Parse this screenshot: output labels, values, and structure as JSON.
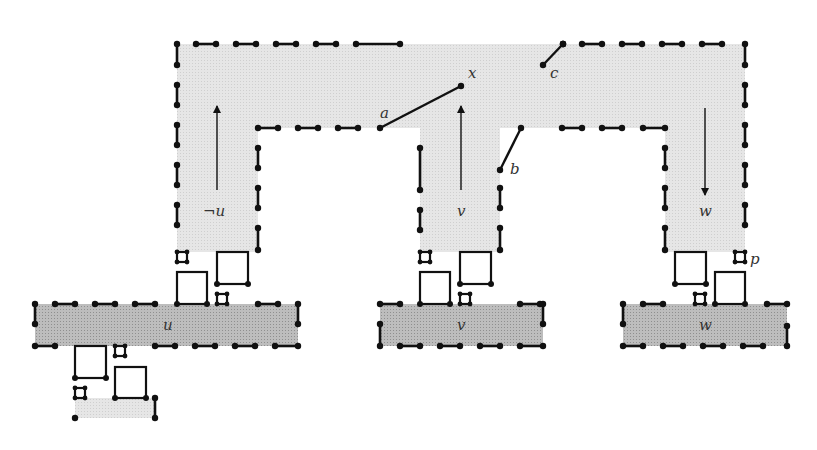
{
  "colors": {
    "background": "#ffffff",
    "light_region": "#e4e4e4",
    "dark_region": "#b4b4b4",
    "stroke": "#111111",
    "label": "#333333"
  },
  "light_regions": [
    {
      "name": "top-bar",
      "x": 177,
      "y": 44,
      "w": 568,
      "h": 84
    },
    {
      "name": "left-leg",
      "x": 177,
      "y": 128,
      "w": 81,
      "h": 124
    },
    {
      "name": "middle-leg",
      "x": 420,
      "y": 128,
      "w": 80,
      "h": 124
    },
    {
      "name": "right-leg",
      "x": 665,
      "y": 128,
      "w": 80,
      "h": 124
    },
    {
      "name": "bottom-left-patch",
      "x": 75,
      "y": 398,
      "w": 80,
      "h": 20
    }
  ],
  "dark_regions": [
    {
      "name": "u-bar",
      "x": 35,
      "y": 304,
      "w": 263,
      "h": 42
    },
    {
      "name": "v-bar",
      "x": 380,
      "y": 304,
      "w": 163,
      "h": 42
    },
    {
      "name": "w-bar",
      "x": 623,
      "y": 304,
      "w": 164,
      "h": 42
    }
  ],
  "segments": [
    [
      177,
      44,
      177,
      65
    ],
    [
      196,
      44,
      216,
      44
    ],
    [
      236,
      44,
      256,
      44
    ],
    [
      276,
      44,
      296,
      44
    ],
    [
      316,
      44,
      336,
      44
    ],
    [
      356,
      44,
      400,
      44
    ],
    [
      177,
      85,
      177,
      105
    ],
    [
      177,
      125,
      177,
      145
    ],
    [
      177,
      165,
      177,
      185
    ],
    [
      177,
      205,
      177,
      225
    ],
    [
      258,
      128,
      278,
      128
    ],
    [
      298,
      128,
      318,
      128
    ],
    [
      338,
      128,
      358,
      128
    ],
    [
      258,
      148,
      258,
      168
    ],
    [
      258,
      188,
      258,
      208
    ],
    [
      258,
      228,
      258,
      250
    ],
    [
      420,
      148,
      420,
      190
    ],
    [
      420,
      210,
      420,
      230
    ],
    [
      500,
      188,
      500,
      208
    ],
    [
      500,
      228,
      500,
      250
    ],
    [
      563,
      44,
      563,
      44
    ],
    [
      582,
      44,
      602,
      44
    ],
    [
      622,
      44,
      642,
      44
    ],
    [
      662,
      44,
      682,
      44
    ],
    [
      702,
      44,
      722,
      44
    ],
    [
      745,
      44,
      745,
      65
    ],
    [
      745,
      85,
      745,
      105
    ],
    [
      745,
      125,
      745,
      145
    ],
    [
      745,
      165,
      745,
      185
    ],
    [
      745,
      205,
      745,
      225
    ],
    [
      562,
      128,
      582,
      128
    ],
    [
      602,
      128,
      622,
      128
    ],
    [
      643,
      128,
      665,
      128
    ],
    [
      665,
      148,
      665,
      168
    ],
    [
      665,
      188,
      665,
      208
    ],
    [
      665,
      228,
      665,
      250
    ],
    [
      35,
      304,
      35,
      324
    ],
    [
      55,
      304,
      75,
      304
    ],
    [
      95,
      304,
      115,
      304
    ],
    [
      135,
      304,
      155,
      304
    ],
    [
      258,
      304,
      278,
      304
    ],
    [
      298,
      304,
      298,
      324
    ],
    [
      35,
      346,
      55,
      346
    ],
    [
      155,
      346,
      175,
      346
    ],
    [
      195,
      346,
      215,
      346
    ],
    [
      235,
      346,
      255,
      346
    ],
    [
      275,
      346,
      298,
      346
    ],
    [
      380,
      304,
      400,
      304
    ],
    [
      520,
      304,
      540,
      304
    ],
    [
      543,
      304,
      543,
      324
    ],
    [
      380,
      324,
      380,
      346
    ],
    [
      400,
      346,
      420,
      346
    ],
    [
      440,
      346,
      460,
      346
    ],
    [
      480,
      346,
      500,
      346
    ],
    [
      520,
      346,
      543,
      346
    ],
    [
      623,
      304,
      623,
      324
    ],
    [
      643,
      304,
      663,
      304
    ],
    [
      767,
      304,
      787,
      304
    ],
    [
      623,
      346,
      643,
      346
    ],
    [
      663,
      346,
      683,
      346
    ],
    [
      703,
      346,
      723,
      346
    ],
    [
      743,
      346,
      763,
      346
    ],
    [
      787,
      326,
      787,
      346
    ],
    [
      155,
      398,
      155,
      418
    ]
  ],
  "dots_only": [
    [
      75,
      418
    ]
  ],
  "boxes": [
    {
      "x": 177,
      "y": 272,
      "w": 30,
      "h": 32
    },
    {
      "x": 217,
      "y": 252,
      "w": 31,
      "h": 32
    },
    {
      "x": 420,
      "y": 272,
      "w": 30,
      "h": 32
    },
    {
      "x": 460,
      "y": 252,
      "w": 31,
      "h": 32
    },
    {
      "x": 675,
      "y": 252,
      "w": 31,
      "h": 32
    },
    {
      "x": 715,
      "y": 272,
      "w": 30,
      "h": 32
    },
    {
      "x": 75,
      "y": 346,
      "w": 31,
      "h": 32
    },
    {
      "x": 115,
      "y": 367,
      "w": 31,
      "h": 31
    }
  ],
  "small_boxes": [
    {
      "x": 177,
      "y": 252,
      "s": 10
    },
    {
      "x": 217,
      "y": 294,
      "s": 10
    },
    {
      "x": 420,
      "y": 252,
      "s": 10
    },
    {
      "x": 460,
      "y": 294,
      "s": 10
    },
    {
      "x": 735,
      "y": 252,
      "s": 10
    },
    {
      "x": 695,
      "y": 294,
      "s": 10
    },
    {
      "x": 115,
      "y": 346,
      "s": 10
    },
    {
      "x": 75,
      "y": 388,
      "s": 10
    }
  ],
  "diagonals": [
    {
      "name": "edge-a-x",
      "x1": 380,
      "y1": 128,
      "x2": 461,
      "y2": 86
    },
    {
      "name": "edge-b",
      "x1": 500,
      "y1": 170,
      "x2": 521,
      "y2": 128
    },
    {
      "name": "edge-c",
      "x1": 543,
      "y1": 65,
      "x2": 563,
      "y2": 44
    }
  ],
  "arrows": [
    {
      "name": "arrow-not-u",
      "x": 217,
      "y1": 190,
      "y2": 106,
      "dir": "up"
    },
    {
      "name": "arrow-v",
      "x": 461,
      "y1": 190,
      "y2": 106,
      "dir": "up"
    },
    {
      "name": "arrow-w",
      "x": 705,
      "y1": 108,
      "y2": 195,
      "dir": "down"
    }
  ],
  "labels": {
    "a": {
      "text": "a",
      "x": 380,
      "y": 118
    },
    "x": {
      "text": "x",
      "x": 468,
      "y": 78
    },
    "c": {
      "text": "c",
      "x": 550,
      "y": 78
    },
    "b": {
      "text": "b",
      "x": 510,
      "y": 174
    },
    "not_u": {
      "text": "¬u",
      "x": 203,
      "y": 216
    },
    "v_leg": {
      "text": "v",
      "x": 457,
      "y": 216
    },
    "w_leg": {
      "text": "w",
      "x": 699,
      "y": 216
    },
    "p": {
      "text": "p",
      "x": 750,
      "y": 264
    },
    "u_bar": {
      "text": "u",
      "x": 163,
      "y": 330
    },
    "v_bar": {
      "text": "v",
      "x": 457,
      "y": 330
    },
    "w_bar": {
      "text": "w",
      "x": 699,
      "y": 330
    }
  }
}
